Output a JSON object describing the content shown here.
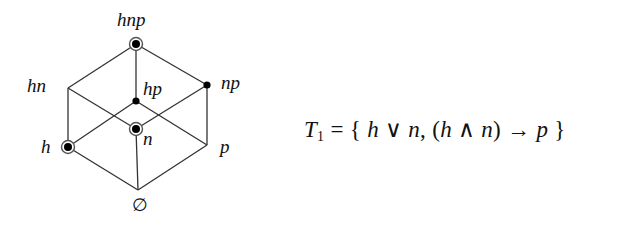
{
  "diagram": {
    "type": "hasse-lattice-cube",
    "nodes": [
      {
        "id": "hnp",
        "label": "hnp",
        "x": 136,
        "y": 44,
        "marker": "circled",
        "label_x": 117,
        "label_y": 26
      },
      {
        "id": "hn",
        "label": "hn",
        "x": 68,
        "y": 88,
        "marker": "none",
        "label_x": 27,
        "label_y": 92
      },
      {
        "id": "hp",
        "label": "hp",
        "x": 136,
        "y": 101,
        "marker": "dot",
        "label_x": 143,
        "label_y": 95
      },
      {
        "id": "np",
        "label": "np",
        "x": 207,
        "y": 85,
        "marker": "dot",
        "label_x": 221,
        "label_y": 89
      },
      {
        "id": "h",
        "label": "h",
        "x": 68,
        "y": 147,
        "marker": "circled",
        "label_x": 41,
        "label_y": 153
      },
      {
        "id": "n",
        "label": "n",
        "x": 136,
        "y": 129,
        "marker": "circled",
        "label_x": 143,
        "label_y": 145
      },
      {
        "id": "p",
        "label": "p",
        "x": 207,
        "y": 145,
        "marker": "none",
        "label_x": 220,
        "label_y": 153
      },
      {
        "id": "empty",
        "label": "∅",
        "x": 138,
        "y": 190,
        "marker": "none",
        "label_x": 132,
        "label_y": 211
      }
    ],
    "edges": [
      [
        "hnp",
        "hn"
      ],
      [
        "hnp",
        "hp"
      ],
      [
        "hnp",
        "np"
      ],
      [
        "hn",
        "h"
      ],
      [
        "hn",
        "n"
      ],
      [
        "hp",
        "h"
      ],
      [
        "hp",
        "p"
      ],
      [
        "np",
        "n"
      ],
      [
        "np",
        "p"
      ],
      [
        "h",
        "empty"
      ],
      [
        "n",
        "empty"
      ],
      [
        "p",
        "empty"
      ]
    ],
    "colors": {
      "line": "#333333",
      "dot": "#000000",
      "ring": "#555555"
    }
  },
  "formula": {
    "lhs_symbol": "T",
    "lhs_subscript": "1",
    "equals": " = ",
    "open_brace": "{ ",
    "term1_a": "h",
    "or_op": " ∨ ",
    "term1_b": "n",
    "comma": ", ",
    "open_paren": "(",
    "term2_a": "h",
    "and_op": " ∧ ",
    "term2_b": "n",
    "close_paren": ")",
    "implies_op": " → ",
    "term2_c": "p",
    "close_brace": " }"
  }
}
